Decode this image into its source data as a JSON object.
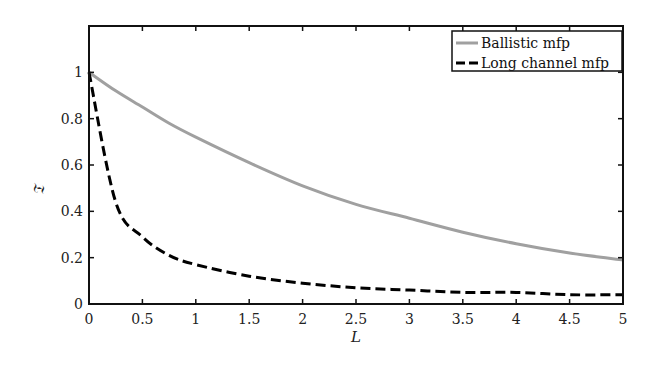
{
  "chart_data": {
    "type": "line",
    "title": "",
    "xlabel": "L",
    "ylabel": "𝔗",
    "xlim": [
      0,
      5
    ],
    "ylim": [
      0,
      1.2
    ],
    "xticks": [
      "0",
      "0.5",
      "1",
      "1.5",
      "2",
      "2.5",
      "3",
      "3.5",
      "4",
      "4.5",
      "5"
    ],
    "yticks": [
      "0",
      "0.2",
      "0.4",
      "0.6",
      "0.8",
      "1"
    ],
    "grid": false,
    "legend_position": "upper right",
    "x": [
      0,
      0.25,
      0.5,
      0.75,
      1,
      1.5,
      2,
      2.5,
      3,
      3.5,
      4,
      4.5,
      5
    ],
    "series": [
      {
        "name": "Ballistic mfp",
        "style": "solid",
        "color": "#a0a0a0",
        "values": [
          1.0,
          0.92,
          0.85,
          0.78,
          0.72,
          0.61,
          0.51,
          0.43,
          0.37,
          0.31,
          0.26,
          0.22,
          0.19
        ]
      },
      {
        "name": "Long channel mfp",
        "style": "dashed",
        "color": "#000000",
        "values": [
          1.0,
          0.44,
          0.29,
          0.21,
          0.17,
          0.12,
          0.09,
          0.07,
          0.06,
          0.05,
          0.05,
          0.04,
          0.04
        ]
      }
    ]
  },
  "legend": {
    "items": [
      {
        "label": "Ballistic mfp"
      },
      {
        "label": "Long channel mfp"
      }
    ]
  },
  "axes": {
    "xlabel": "L",
    "ylabel": "𝔗"
  }
}
